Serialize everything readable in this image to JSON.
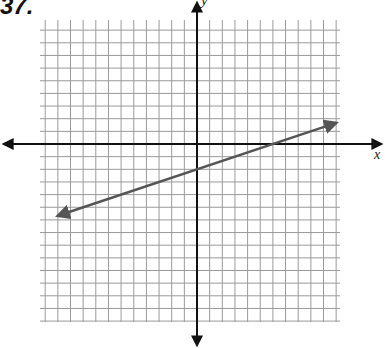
{
  "problem": {
    "number": "37."
  },
  "axes": {
    "x_label": "x",
    "y_label": "y"
  },
  "colors": {
    "grid": "#9a9a9a",
    "axis": "#111111",
    "line": "#555555",
    "background": "#ffffff"
  },
  "chart_data": {
    "type": "line",
    "title": "37.",
    "xlabel": "x",
    "ylabel": "y",
    "grid": true,
    "xlim": [
      -12,
      11
    ],
    "ylim": [
      -12,
      11
    ],
    "tick_labels": [],
    "series": [
      {
        "name": "graphed line",
        "equation": "y = (1/3)x - 2",
        "slope": 0.3333,
        "y_intercept": -2,
        "x_intercept": 6,
        "x": [
          -11,
          -6,
          -3,
          0,
          3,
          6,
          9,
          11
        ],
        "y": [
          -5.67,
          -4,
          -3,
          -2,
          -1,
          0,
          1,
          1.67
        ],
        "arrows_both_ends": true
      }
    ]
  }
}
